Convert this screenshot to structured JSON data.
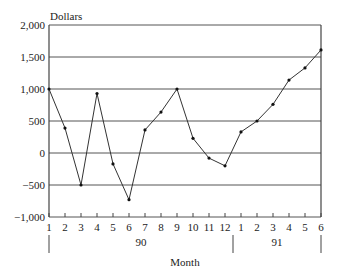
{
  "chart_data": {
    "type": "line",
    "title": "",
    "ylabel": "Dollars",
    "xlabel": "Month",
    "ylim": [
      -1000,
      2000
    ],
    "yticks": [
      2000,
      1500,
      1000,
      500,
      0,
      -500,
      -1000
    ],
    "ytick_labels": [
      "2,000",
      "1,500",
      "1,000",
      "500",
      "0",
      "−500",
      "−1,000"
    ],
    "grid": true,
    "legend": null,
    "categories": [
      "1",
      "2",
      "3",
      "4",
      "5",
      "6",
      "7",
      "8",
      "9",
      "10",
      "11",
      "12",
      "1",
      "2",
      "3",
      "4",
      "5",
      "6"
    ],
    "year_groups": [
      {
        "label": "90",
        "start_index": 0,
        "end_index": 11
      },
      {
        "label": "91",
        "start_index": 12,
        "end_index": 17
      }
    ],
    "series": [
      {
        "name": "Dollars",
        "values": [
          1000,
          390,
          -500,
          930,
          -170,
          -730,
          360,
          640,
          1000,
          230,
          -80,
          -200,
          330,
          500,
          760,
          1140,
          1330,
          1610
        ]
      }
    ]
  }
}
